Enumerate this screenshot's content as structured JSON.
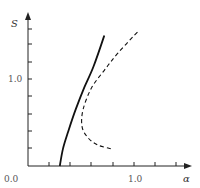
{
  "chart_data": {
    "type": "line",
    "title": "",
    "xlabel": "α",
    "ylabel": "S",
    "xlim": [
      0.0,
      1.4
    ],
    "ylim": [
      0.0,
      1.6
    ],
    "x_tick_labels": [
      "0.0",
      "1.0"
    ],
    "y_tick_labels": [
      "1.0"
    ],
    "x_ticks_minor_step": 0.2,
    "y_ticks_minor_step": 0.2,
    "grid": false,
    "legend": null,
    "series": [
      {
        "name": "solid",
        "style": "solid",
        "x": [
          0.3,
          0.33,
          0.38,
          0.45,
          0.53,
          0.62,
          0.72
        ],
        "y": [
          0.0,
          0.2,
          0.4,
          0.65,
          0.9,
          1.15,
          1.5
        ]
      },
      {
        "name": "dashed",
        "style": "dashed",
        "x": [
          0.78,
          0.66,
          0.57,
          0.51,
          0.52,
          0.6,
          0.72,
          0.85,
          1.04
        ],
        "y": [
          0.2,
          0.24,
          0.32,
          0.45,
          0.65,
          0.9,
          1.1,
          1.3,
          1.55
        ]
      }
    ]
  },
  "labels": {
    "x_origin": "0.0",
    "x_one": "1.0",
    "y_one": "1.0",
    "x_axis": "α",
    "y_axis": "S"
  }
}
